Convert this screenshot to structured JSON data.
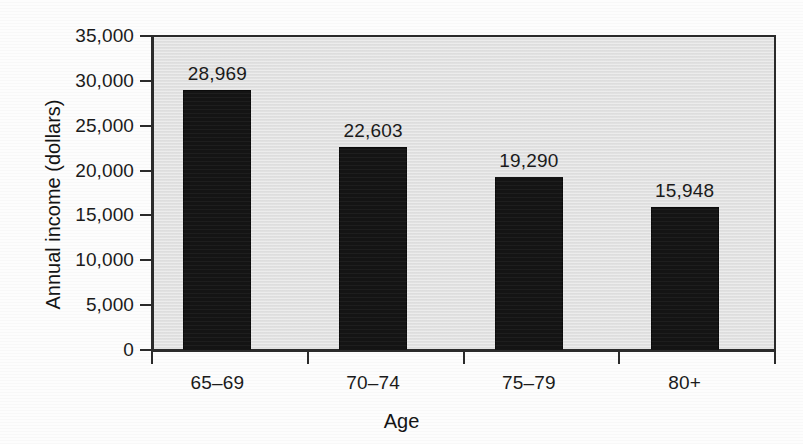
{
  "chart_data": {
    "type": "bar",
    "title": "",
    "subtitle": "",
    "xlabel": "Age",
    "ylabel": "Annual income (dollars)",
    "categories": [
      "65–69",
      "70–74",
      "75–79",
      "80+"
    ],
    "values": [
      28969,
      22603,
      19290,
      15948
    ],
    "value_labels": [
      "28,969",
      "22,603",
      "19,290",
      "15,948"
    ],
    "ylim": [
      0,
      35000
    ],
    "ytick_values": [
      0,
      5000,
      10000,
      15000,
      20000,
      25000,
      30000,
      35000
    ],
    "ytick_labels": [
      "0",
      "5,000",
      "10,000",
      "15,000",
      "20,000",
      "25,000",
      "30,000",
      "35,000"
    ],
    "grid": false,
    "legend": null,
    "bar_color": "#141414",
    "plot_background": "#e4e4e4",
    "page_background": "#fdfdfd",
    "axis_color": "#2b2b2b",
    "series": [
      {
        "name": "Annual income",
        "values": [
          28969,
          22603,
          19290,
          15948
        ]
      }
    ]
  },
  "axes": {
    "y_title": "Annual income (dollars)",
    "x_title": "Age"
  }
}
